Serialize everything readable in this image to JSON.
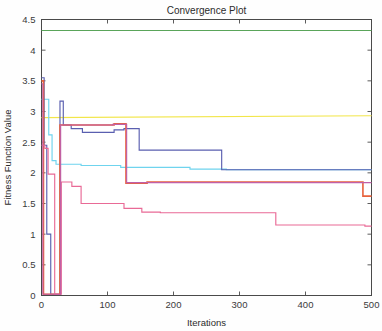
{
  "chart_data": {
    "type": "line",
    "title": "Convergence Plot",
    "xlabel": "Iterations",
    "ylabel": "Fitness Function Value",
    "xlim": [
      0,
      500
    ],
    "ylim": [
      0,
      4.5
    ],
    "xticks": [
      0,
      100,
      200,
      300,
      400,
      500
    ],
    "xtick_labels": [
      "0",
      "100",
      "200",
      "300",
      "400",
      "500"
    ],
    "yticks": [
      0,
      0.5,
      1,
      1.5,
      2,
      2.5,
      3,
      3.5,
      4,
      4.5
    ],
    "ytick_labels": [
      "0",
      "0.5",
      "1",
      "1.5",
      "2",
      "2.5",
      "3",
      "3.5",
      "4",
      "4.5"
    ],
    "grid": false,
    "legend": "none",
    "background": "#ffffff",
    "axis_color": "#4a4a4a",
    "series": [
      {
        "name": "green-flat",
        "color": "#5aa55a",
        "thick": false,
        "points": [
          [
            0,
            4.32
          ],
          [
            500,
            4.32
          ]
        ]
      },
      {
        "name": "yellow-flat",
        "color": "#f2e64a",
        "thick": false,
        "points": [
          [
            0,
            2.9
          ],
          [
            500,
            2.93
          ]
        ]
      },
      {
        "name": "cyan",
        "color": "#6fd4ee",
        "thick": false,
        "points": [
          [
            0,
            3.2
          ],
          [
            11,
            3.2
          ],
          [
            11,
            2.62
          ],
          [
            16,
            2.62
          ],
          [
            16,
            2.2
          ],
          [
            22,
            2.2
          ],
          [
            22,
            2.14
          ],
          [
            60,
            2.14
          ],
          [
            60,
            2.12
          ],
          [
            120,
            2.12
          ],
          [
            120,
            2.09
          ],
          [
            225,
            2.09
          ],
          [
            225,
            2.06
          ],
          [
            280,
            2.06
          ],
          [
            280,
            2.05
          ],
          [
            500,
            2.05
          ]
        ]
      },
      {
        "name": "darkblue",
        "color": "#5a5fb0",
        "thick": false,
        "points": [
          [
            0,
            3.55
          ],
          [
            4,
            3.55
          ],
          [
            4,
            2.45
          ],
          [
            8,
            2.45
          ],
          [
            8,
            1.0
          ],
          [
            14,
            1.0
          ],
          [
            14,
            0.02
          ],
          [
            28,
            0.02
          ],
          [
            28,
            3.17
          ],
          [
            33,
            3.17
          ],
          [
            33,
            2.78
          ],
          [
            45,
            2.78
          ],
          [
            45,
            2.72
          ],
          [
            62,
            2.72
          ],
          [
            62,
            2.66
          ],
          [
            110,
            2.66
          ],
          [
            110,
            2.7
          ],
          [
            125,
            2.7
          ],
          [
            125,
            2.72
          ],
          [
            148,
            2.72
          ],
          [
            148,
            2.37
          ],
          [
            273,
            2.37
          ],
          [
            273,
            2.05
          ],
          [
            500,
            2.05
          ]
        ]
      },
      {
        "name": "red",
        "color": "#e8623c",
        "thick": true,
        "points": [
          [
            0,
            3.5
          ],
          [
            3,
            3.5
          ],
          [
            3,
            0.02
          ],
          [
            28,
            0.02
          ],
          [
            28,
            2.78
          ],
          [
            110,
            2.78
          ],
          [
            110,
            2.8
          ],
          [
            128,
            2.8
          ],
          [
            128,
            1.83
          ],
          [
            160,
            1.83
          ],
          [
            160,
            1.85
          ],
          [
            487,
            1.85
          ],
          [
            487,
            1.62
          ],
          [
            500,
            1.62
          ]
        ]
      },
      {
        "name": "pink",
        "color": "#e96a96",
        "thick": false,
        "points": [
          [
            0,
            2.45
          ],
          [
            5,
            2.45
          ],
          [
            5,
            2.4
          ],
          [
            10,
            2.4
          ],
          [
            10,
            1.98
          ],
          [
            20,
            1.98
          ],
          [
            20,
            0.02
          ],
          [
            30,
            0.02
          ],
          [
            30,
            1.85
          ],
          [
            46,
            1.85
          ],
          [
            46,
            1.78
          ],
          [
            60,
            1.78
          ],
          [
            60,
            1.5
          ],
          [
            125,
            1.5
          ],
          [
            125,
            1.42
          ],
          [
            152,
            1.42
          ],
          [
            152,
            1.36
          ],
          [
            180,
            1.36
          ],
          [
            180,
            1.35
          ],
          [
            355,
            1.35
          ],
          [
            355,
            1.15
          ],
          [
            490,
            1.15
          ],
          [
            490,
            1.13
          ],
          [
            500,
            1.13
          ]
        ]
      },
      {
        "name": "magenta-spike",
        "color": "#c060a8",
        "thick": false,
        "points": [
          [
            0,
            3.45
          ],
          [
            2,
            3.45
          ],
          [
            2,
            0.02
          ],
          [
            29,
            0.02
          ],
          [
            29,
            2.78
          ],
          [
            108,
            2.78
          ],
          [
            108,
            2.79
          ],
          [
            129,
            2.79
          ],
          [
            129,
            1.84
          ],
          [
            500,
            1.84
          ]
        ]
      }
    ]
  }
}
